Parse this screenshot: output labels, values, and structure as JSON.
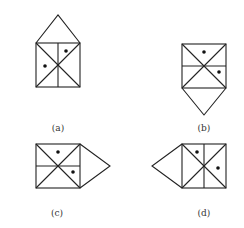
{
  "figures": [
    {
      "id": "a",
      "label": "(a)",
      "square": {
        "x": 36,
        "y": 43,
        "size": 44
      },
      "divider": "vertical",
      "triangle": {
        "side": "top",
        "apex": [
          58,
          15
        ]
      },
      "dots": [
        [
          66,
          51
        ],
        [
          45,
          66
        ]
      ],
      "label_pos": [
        58,
        131
      ]
    },
    {
      "id": "b",
      "label": "(b)",
      "square": {
        "x": 182,
        "y": 44,
        "size": 44
      },
      "divider": "horizontal",
      "triangle": {
        "side": "bottom",
        "apex": [
          204,
          115
        ]
      },
      "dots": [
        [
          204,
          52
        ],
        [
          219,
          72
        ]
      ],
      "label_pos": [
        204,
        131
      ]
    },
    {
      "id": "c",
      "label": "(c)",
      "square": {
        "x": 36,
        "y": 144,
        "size": 44
      },
      "divider": "horizontal",
      "triangle": {
        "side": "right",
        "apex": [
          110,
          166
        ]
      },
      "dots": [
        [
          58,
          152
        ],
        [
          73,
          172
        ]
      ],
      "label_pos": [
        57,
        216
      ]
    },
    {
      "id": "d",
      "label": "(d)",
      "square": {
        "x": 182,
        "y": 144,
        "size": 44
      },
      "divider": "vertical",
      "triangle": {
        "side": "left",
        "apex": [
          152,
          166
        ]
      },
      "dots": [
        [
          197,
          152
        ],
        [
          218,
          168
        ]
      ],
      "label_pos": [
        204,
        216
      ]
    }
  ]
}
